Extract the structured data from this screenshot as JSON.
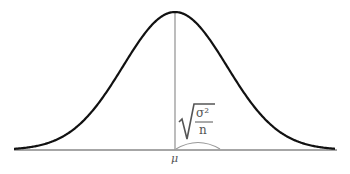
{
  "diagram": {
    "type": "normal-distribution-curve",
    "center_label": "μ",
    "formula": {
      "radical": "√",
      "numerator": "σ²",
      "denominator": "n",
      "meaning": "standard error"
    },
    "colors": {
      "curve": "#111111",
      "axis": "#888888",
      "center_line": "#888888",
      "arc": "#888888",
      "text": "#555555"
    }
  }
}
